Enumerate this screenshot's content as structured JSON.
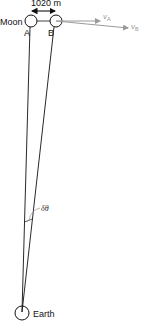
{
  "diagram": {
    "distance_label": "1020 m",
    "moon_label": "Moon",
    "point_a_label": "A",
    "point_b_label": "B",
    "velocity_a": {
      "symbol": "v",
      "subscript": "A"
    },
    "velocity_b": {
      "symbol": "v",
      "subscript": "B"
    },
    "angle_label": "δθ",
    "earth_label": "Earth",
    "colors": {
      "line": "#111111",
      "velocity_arrows": "#9a9a9a",
      "background": "#ffffff"
    }
  }
}
